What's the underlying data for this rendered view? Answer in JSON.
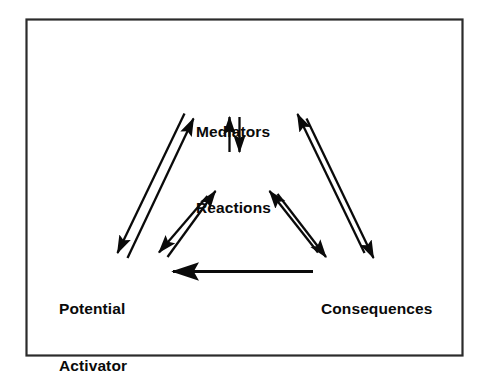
{
  "figure": {
    "type": "cyclic-process-diagram",
    "title": "",
    "border_color": "#2b2b2b",
    "ink_color": "#0a0a0a",
    "background_color": "#ffffff",
    "nodes": [
      {
        "id": "mediators",
        "label": "Mediators",
        "lines": [
          "Mediators"
        ],
        "position": "top-center"
      },
      {
        "id": "reactions",
        "label": "Reactions",
        "lines": [
          "Reactions"
        ],
        "position": "center"
      },
      {
        "id": "potential_activator",
        "label": "Potential Activator",
        "lines": [
          "Potential",
          "Activator"
        ],
        "position": "bottom-left"
      },
      {
        "id": "consequences",
        "label": "Consequences",
        "lines": [
          "Consequences"
        ],
        "position": "bottom-right"
      }
    ],
    "connections": [
      {
        "from": "mediators",
        "to": "reactions",
        "style": "bidirectional",
        "orientation": "vertical"
      },
      {
        "from": "potential_activator",
        "to": "mediators",
        "style": "bidirectional",
        "orientation": "diagonal-outer-left"
      },
      {
        "from": "mediators",
        "to": "consequences",
        "style": "bidirectional",
        "orientation": "diagonal-outer-right"
      },
      {
        "from": "potential_activator",
        "to": "reactions",
        "style": "bidirectional",
        "orientation": "diagonal-inner-left"
      },
      {
        "from": "reactions",
        "to": "consequences",
        "style": "bidirectional",
        "orientation": "diagonal-inner-right"
      },
      {
        "from": "consequences",
        "to": "potential_activator",
        "style": "unidirectional",
        "orientation": "horizontal"
      }
    ]
  }
}
